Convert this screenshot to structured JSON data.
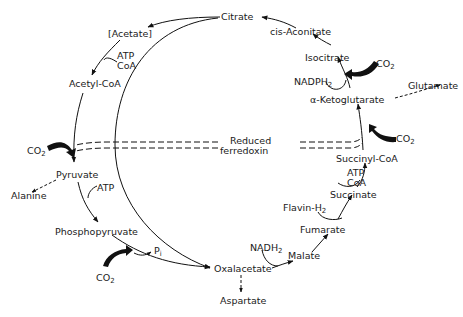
{
  "diagram": {
    "type": "metabolic-pathway",
    "metabolites": {
      "citrate": "Citrate",
      "cis_aconitate": "cis-Aconitate",
      "isocitrate": "Isocitrate",
      "alpha_ketoglutarate": "α-Ketoglutarate",
      "glutamate": "Glutamate",
      "succinyl_coa": "Succinyl-CoA",
      "succinate": "Succinate",
      "fumarate": "Fumarate",
      "malate": "Malate",
      "oxalacetate": "Oxalacetate",
      "aspartate": "Aspartate",
      "phosphopyruvate": "Phosphopyruvate",
      "pyruvate": "Pyruvate",
      "alanine": "Alanine",
      "acetyl_coa": "Acetyl-CoA",
      "acetate": "[Acetate]"
    },
    "cofactors": {
      "atp_coa_top": {
        "line1": "ATP",
        "line2": "CoA"
      },
      "atp_coa_right": {
        "line1": "ATP",
        "line2": "CoA"
      },
      "atp_left": "ATP",
      "nadph2": {
        "base": "NADPH",
        "sub": "2"
      },
      "nadh2": {
        "base": "NADH",
        "sub": "2"
      },
      "flavin_h2": {
        "base": "Flavin-H",
        "sub": "2"
      },
      "pi": {
        "base": "P",
        "sub": "i"
      },
      "co2_label": {
        "base": "CO",
        "sub": "2"
      },
      "reduced_ferredoxin": {
        "line1": "Reduced",
        "line2": "ferredoxin"
      }
    },
    "edges": [
      {
        "from": "Citrate",
        "to": "[Acetate]",
        "style": "solid"
      },
      {
        "from": "[Acetate]",
        "to": "Acetyl-CoA",
        "style": "solid",
        "cofactor": "ATP, CoA"
      },
      {
        "from": "Acetyl-CoA",
        "to": "Pyruvate",
        "style": "solid",
        "cofactor": "CO2, Reduced ferredoxin"
      },
      {
        "from": "Pyruvate",
        "to": "Alanine",
        "style": "dashed"
      },
      {
        "from": "Pyruvate",
        "to": "Phosphopyruvate",
        "style": "solid",
        "cofactor": "ATP"
      },
      {
        "from": "Phosphopyruvate",
        "to": "Oxalacetate",
        "style": "solid",
        "cofactor": "CO2, Pi"
      },
      {
        "from": "Citrate",
        "to": "Oxalacetate",
        "style": "solid"
      },
      {
        "from": "Oxalacetate",
        "to": "Aspartate",
        "style": "dashed"
      },
      {
        "from": "Oxalacetate",
        "to": "Malate",
        "style": "solid",
        "cofactor": "NADH2"
      },
      {
        "from": "Malate",
        "to": "Fumarate",
        "style": "solid"
      },
      {
        "from": "Fumarate",
        "to": "Succinate",
        "style": "solid",
        "cofactor": "Flavin-H2"
      },
      {
        "from": "Succinate",
        "to": "Succinyl-CoA",
        "style": "solid",
        "cofactor": "ATP, CoA"
      },
      {
        "from": "Succinyl-CoA",
        "to": "α-Ketoglutarate",
        "style": "solid",
        "cofactor": "CO2, Reduced ferredoxin"
      },
      {
        "from": "α-Ketoglutarate",
        "to": "Glutamate",
        "style": "dashed"
      },
      {
        "from": "α-Ketoglutarate",
        "to": "Isocitrate",
        "style": "solid",
        "cofactor": "CO2, NADPH2"
      },
      {
        "from": "Isocitrate",
        "to": "cis-Aconitate",
        "style": "solid"
      },
      {
        "from": "cis-Aconitate",
        "to": "Citrate",
        "style": "solid"
      }
    ]
  }
}
